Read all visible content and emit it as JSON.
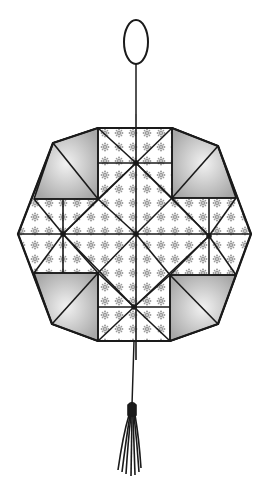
{
  "illustration": {
    "subject": "octagonal patchwork quilt ornament with hanging loop and tassel",
    "colors": {
      "outline": "#1a1a1a",
      "fabric_background": "#ffffff",
      "flower_motif": "#9a9a9a",
      "shaded_corner_light": "#f2f2f2",
      "shaded_corner_dark": "#a8a8a8"
    },
    "parts": [
      "hanging-loop",
      "hanging-string",
      "octagon-quilt-block",
      "tassel-string",
      "tassel"
    ]
  }
}
